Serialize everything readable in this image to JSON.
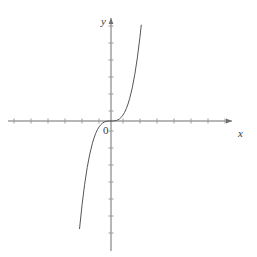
{
  "figure": {
    "background_color": "#ffffff",
    "width": 257,
    "height": 257,
    "labels": {
      "y_axis": "y",
      "x_axis": "x",
      "origin": "0"
    }
  },
  "chart_data": {
    "type": "line",
    "title": "",
    "subtitle": "",
    "xlabel": "x",
    "ylabel": "y",
    "origin_label": "0",
    "function": "y = x^3",
    "grid": false,
    "legend": null,
    "legend_position": "none",
    "axis_color": "#6e6e6e",
    "curve_color": "#555555",
    "curve_width": 1,
    "xlim": [
      -6.1,
      7.2
    ],
    "ylim": [
      -7.6,
      6.1
    ],
    "xticks": [
      -6,
      -5,
      -4,
      -3,
      -2,
      -1,
      1,
      2,
      3,
      4,
      5,
      6,
      7
    ],
    "yticks": [
      -7,
      -6,
      -5,
      -4,
      -3,
      -2,
      -1,
      1,
      2,
      3,
      4,
      5,
      6
    ],
    "xtick_labels": [],
    "ytick_labels": [],
    "x_axis_arrow": "right",
    "y_axis_arrow": "up",
    "annotations": [],
    "x": [
      -1.85,
      -1.7,
      -1.55,
      -1.4,
      -1.25,
      -1.1,
      -1.0,
      -0.9,
      -0.8,
      -0.7,
      -0.6,
      -0.5,
      -0.4,
      -0.3,
      -0.2,
      -0.1,
      0.0,
      0.1,
      0.2,
      0.3,
      0.4,
      0.5,
      0.6,
      0.7,
      0.8,
      0.9,
      1.0,
      1.1,
      1.25,
      1.4,
      1.55,
      1.7,
      1.78
    ],
    "values": [
      -6.33,
      -4.91,
      -3.72,
      -2.74,
      -1.95,
      -1.33,
      -1.0,
      -0.729,
      -0.512,
      -0.343,
      -0.216,
      -0.125,
      -0.064,
      -0.027,
      -0.008,
      -0.001,
      0.0,
      0.001,
      0.008,
      0.027,
      0.064,
      0.125,
      0.216,
      0.343,
      0.512,
      0.729,
      1.0,
      1.33,
      1.95,
      2.74,
      3.72,
      4.91,
      5.64
    ]
  }
}
